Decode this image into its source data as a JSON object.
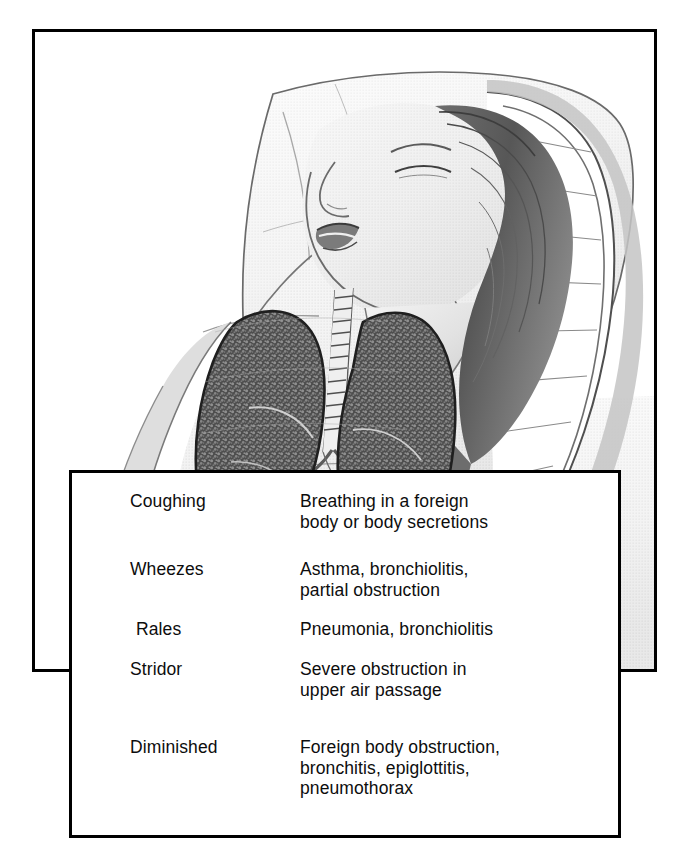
{
  "page": {
    "background_color": "#ffffff",
    "border_color": "#000000"
  },
  "illustration": {
    "alt": "Pencil illustration of a reclining person on a pillow with head tilted back, showing trachea and lungs anatomical overlay",
    "elements": [
      {
        "name": "pillow",
        "label": "pillow"
      },
      {
        "name": "head",
        "label": "head tilted back"
      },
      {
        "name": "hair",
        "label": "long hair"
      },
      {
        "name": "open-mouth",
        "label": "open mouth"
      },
      {
        "name": "trachea",
        "label": "trachea"
      },
      {
        "name": "left-lung",
        "label": "left lung"
      },
      {
        "name": "right-lung",
        "label": "right lung"
      },
      {
        "name": "torso",
        "label": "torso"
      },
      {
        "name": "arm",
        "label": "arm"
      },
      {
        "name": "bed-sheet",
        "label": "bed sheet"
      },
      {
        "name": "blanket",
        "label": "blanket"
      },
      {
        "name": "mattress-edge",
        "label": "quilted mattress edge"
      }
    ]
  },
  "table": {
    "columns": [
      "Sign",
      "Cause"
    ],
    "rows": [
      {
        "sign": "Coughing",
        "cause": "Breathing in a foreign\nbody or body secretions"
      },
      {
        "sign": "Wheezes",
        "cause": "Asthma, bronchiolitis,\npartial obstruction"
      },
      {
        "sign": "Rales",
        "cause": "Pneumonia, bronchiolitis"
      },
      {
        "sign": "Stridor",
        "cause": "Severe obstruction in\nupper air passage"
      },
      {
        "sign": "Diminished",
        "cause": "Foreign body obstruction,\nbronchitis, epiglottitis,\npneumothorax"
      }
    ],
    "row_positions": [
      18,
      86,
      146,
      186,
      264
    ],
    "sign_offsets": [
      0,
      0,
      6,
      0,
      0
    ]
  }
}
